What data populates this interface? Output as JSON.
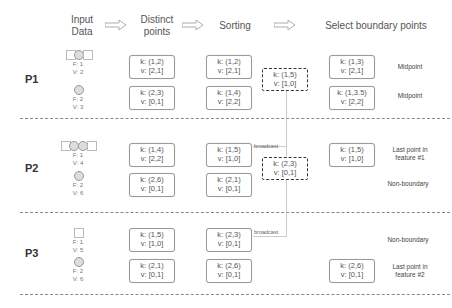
{
  "headers": {
    "input": "Input\nData",
    "input_l1": "Input",
    "input_l2": "Data",
    "distinct_l1": "Distinct",
    "distinct_l2": "points",
    "sorting": "Sorting",
    "select": "Select boundary points"
  },
  "icons": {
    "arrow": "hollow-right-arrow"
  },
  "partitions": [
    {
      "label": "P1",
      "inputs": [
        {
          "f": "F: 1",
          "v": "V: 2",
          "shape": "circle-in-squares-1"
        },
        {
          "f": "F: 2",
          "v": "V: 3",
          "shape": "circle"
        }
      ],
      "distinct": [
        {
          "k": "k: (1,2)",
          "v": "v: [2,1]"
        },
        {
          "k": "k: (2,3)",
          "v": "v: [0,1]"
        }
      ],
      "sorting": [
        {
          "k": "k: (1,2)",
          "v": "v: [2,1]"
        },
        {
          "k": "k: (1,4)",
          "v": "v: [2,2]"
        }
      ],
      "broadcast_box": {
        "k": "k: (1,5)",
        "v": "v: [1,0]"
      },
      "boundary": [
        {
          "k": "k: (1,3)",
          "v": "v: [2,1]",
          "note": "Midpoint"
        },
        {
          "k": "k: (1,3.5)",
          "v": "v: [2,2]",
          "note": "Midpoint"
        }
      ]
    },
    {
      "label": "P2",
      "inputs": [
        {
          "f": "F: 1",
          "v": "V: 4",
          "shape": "circles-in-squares-2"
        },
        {
          "f": "F: 2",
          "v": "V: 6",
          "shape": "circle"
        }
      ],
      "distinct": [
        {
          "k": "k: (1,4)",
          "v": "v: [2,2]"
        },
        {
          "k": "k: (2,6)",
          "v": "v: [0,1]"
        }
      ],
      "sorting": [
        {
          "k": "k: (1,5)",
          "v": "v: [1,0]"
        },
        {
          "k": "k: (2,1)",
          "v": "v: [0,1]"
        }
      ],
      "broadcast_label": "broadcast",
      "broadcast_box": {
        "k": "k: (2,3)",
        "v": "v: [0,1]"
      },
      "boundary": [
        {
          "k": "k: (1,5)",
          "v": "v: [1,0]",
          "note": "Last point in feature #1"
        }
      ],
      "notes": [
        "Non-boundary"
      ]
    },
    {
      "label": "P3",
      "inputs": [
        {
          "f": "F: 1",
          "v": "V: 5",
          "shape": "square"
        },
        {
          "f": "F: 2",
          "v": "V: 6",
          "shape": "circle"
        }
      ],
      "distinct": [
        {
          "k": "k: (1,5)",
          "v": "v: [1,0]"
        },
        {
          "k": "k: (2,1)",
          "v": "v: [0,1]"
        }
      ],
      "sorting": [
        {
          "k": "k: (2,3)",
          "v": "v: [0,1]"
        },
        {
          "k": "k: (2,6)",
          "v": "v: [0,1]"
        }
      ],
      "broadcast_label": "broadcast",
      "boundary": [
        {
          "k": "k: (2,6)",
          "v": "v: [0,1]",
          "note": "Last point in feature #2"
        }
      ],
      "notes": [
        "Non-boundary"
      ]
    }
  ],
  "notes": {
    "p2_last_l1": "Last point in",
    "p2_last_l2": "feature #1",
    "p3_last_l1": "Last point in",
    "p3_last_l2": "feature #2"
  }
}
